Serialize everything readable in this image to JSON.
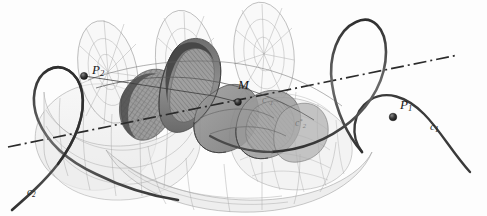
{
  "figure": {
    "background_color": "#fdfdfd",
    "width": 487,
    "height": 216,
    "colors": {
      "curve_dark": "#3a3a3a",
      "mesh_light": "#9a9a9a",
      "surface_light": "#e9e9e9",
      "surface_mid": "#bdbdbd",
      "surface_dark": "#7b7b7b",
      "surface_darkest": "#5d5d5d",
      "axis": "#2b2b2b",
      "point_marker": "#2a2a2a",
      "label_text": "#1a1a1a",
      "label_faint": "#6d6d6d"
    }
  },
  "labels": [
    {
      "id": "P2",
      "text_main": "P",
      "text_sub": "2",
      "text_sup": "",
      "x": 92,
      "y": 63,
      "style": "main",
      "name": "label-p2"
    },
    {
      "id": "M",
      "text_main": "M",
      "text_sub": "",
      "text_sup": "",
      "x": 238,
      "y": 78,
      "style": "main",
      "name": "label-m"
    },
    {
      "id": "P1",
      "text_main": "P",
      "text_sub": "1",
      "text_sup": "",
      "x": 400,
      "y": 98,
      "style": "main",
      "name": "label-p1"
    },
    {
      "id": "c1",
      "text_main": "c",
      "text_sub": "1",
      "text_sup": "",
      "x": 430,
      "y": 121,
      "style": "curve",
      "name": "label-c1"
    },
    {
      "id": "c2",
      "text_main": "c",
      "text_sub": "2",
      "text_sup": "",
      "x": 27,
      "y": 186,
      "style": "curve",
      "name": "label-c2"
    },
    {
      "id": "c1star",
      "text_main": "c",
      "text_sub": "1",
      "text_sup": "*",
      "x": 262,
      "y": 95,
      "style": "faint",
      "name": "label-c1-star"
    },
    {
      "id": "c2star",
      "text_main": "c",
      "text_sub": "2",
      "text_sup": "*",
      "x": 295,
      "y": 118,
      "style": "faint",
      "name": "label-c2-star"
    }
  ],
  "points": [
    {
      "id": "P2",
      "x": 84,
      "y": 76,
      "r": 3.6,
      "name": "point-marker-p2"
    },
    {
      "id": "M",
      "x": 238,
      "y": 102,
      "r": 3.4,
      "name": "point-marker-m"
    },
    {
      "id": "P1",
      "x": 393,
      "y": 117,
      "r": 3.8,
      "name": "point-marker-p1"
    }
  ],
  "axis": {
    "name": "dash-dot-axis",
    "x1": 8,
    "y1": 147,
    "x2": 458,
    "y2": 55,
    "dash_pattern": "13,4,2,4"
  },
  "curves": [
    {
      "id": "c1",
      "name": "helix-curve-c1",
      "description": "thick dark helix on the right passing through P1"
    },
    {
      "id": "c2",
      "name": "helix-curve-c2",
      "description": "thick dark helix on the left passing through P2"
    },
    {
      "id": "c1star",
      "name": "helix-curve-c1-star",
      "description": "inner helix on the darker ribbon"
    },
    {
      "id": "c2star",
      "name": "helix-curve-c2-star",
      "description": "inner helix on the darker ribbon, lower"
    }
  ],
  "surfaces": [
    {
      "id": "outer-helicoid",
      "name": "outer-helicoid-mesh",
      "shading": "light",
      "description": "large light wireframe helicoid with radial and circular grid lines"
    },
    {
      "id": "inner-helicoid",
      "name": "inner-helicoid-ribbon",
      "shading": "dark",
      "description": "narrow dark shaded helicoid ribbon with cross-hatched texture along the axis"
    }
  ]
}
